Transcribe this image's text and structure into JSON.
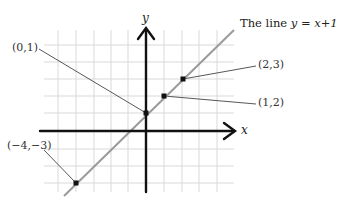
{
  "figure": {
    "title_prefix": "The line ",
    "title_equation": "y = x+1",
    "x_axis_label": "x",
    "y_axis_label": "y",
    "points": [
      {
        "label": "(0,1)",
        "x": 0,
        "y": 1
      },
      {
        "label": "(2,3)",
        "x": 2,
        "y": 3
      },
      {
        "label": "(1,2)",
        "x": 1,
        "y": 2
      },
      {
        "label": "(−4,−3)",
        "x": -4,
        "y": -3
      }
    ],
    "colors": {
      "grid": "#d9d9d9",
      "axes": "#111111",
      "line": "#9a9a9a",
      "point": "#111111",
      "leader": "#444444"
    }
  }
}
